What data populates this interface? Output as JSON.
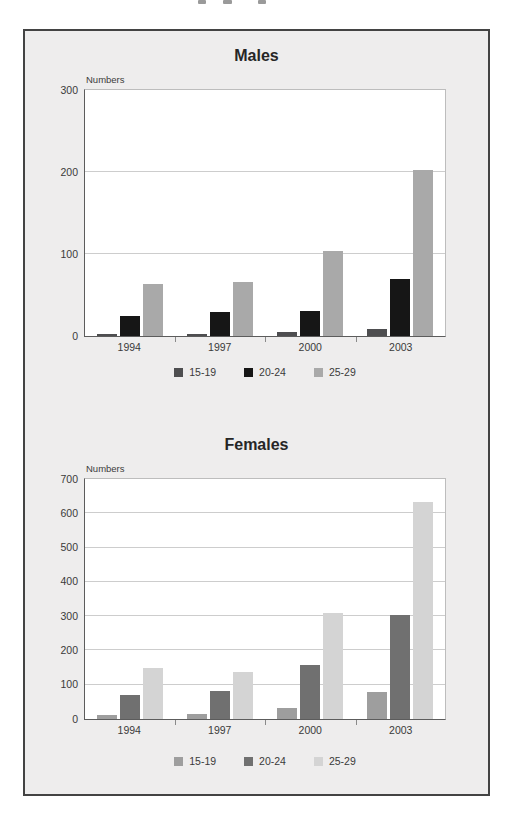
{
  "chart_data": [
    {
      "type": "bar",
      "title": "Males",
      "ylabel": "Numbers",
      "xlabel": "",
      "categories": [
        "1994",
        "1997",
        "2000",
        "2003"
      ],
      "series": [
        {
          "name": "15-19",
          "color": "#4e4e50",
          "values": [
            3,
            2,
            5,
            9
          ]
        },
        {
          "name": "20-24",
          "color": "#161616",
          "values": [
            24,
            29,
            30,
            70
          ]
        },
        {
          "name": "25-29",
          "color": "#a9a9a9",
          "values": [
            64,
            66,
            104,
            203
          ]
        }
      ],
      "ylim": [
        0,
        300
      ],
      "yticks": [
        0,
        100,
        200,
        300
      ],
      "grid": true,
      "legend_position": "bottom"
    },
    {
      "type": "bar",
      "title": "Females",
      "ylabel": "Numbers",
      "xlabel": "",
      "categories": [
        "1994",
        "1997",
        "2000",
        "2003"
      ],
      "series": [
        {
          "name": "15-19",
          "color": "#9e9e9e",
          "values": [
            13,
            15,
            32,
            78
          ]
        },
        {
          "name": "20-24",
          "color": "#707070",
          "values": [
            70,
            81,
            157,
            303
          ]
        },
        {
          "name": "25-29",
          "color": "#d4d4d4",
          "values": [
            150,
            137,
            310,
            632
          ]
        }
      ],
      "ylim": [
        0,
        700
      ],
      "yticks": [
        0,
        100,
        200,
        300,
        400,
        500,
        600,
        700
      ],
      "grid": true,
      "legend_position": "bottom"
    }
  ]
}
